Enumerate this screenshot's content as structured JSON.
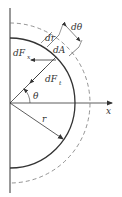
{
  "diagram": {
    "type": "geometry-force-diagram",
    "labels": {
      "d_theta": "dθ",
      "dr": "dr",
      "dA": "dA",
      "dFx_main": "dF",
      "dFx_sub": "x",
      "dFt_main": "dF",
      "dFt_sub": "t",
      "theta": "θ",
      "r": "r",
      "x_axis": "x"
    },
    "colors": {
      "stroke": "#333333",
      "dashed": "#777777",
      "background": "#ffffff"
    }
  }
}
